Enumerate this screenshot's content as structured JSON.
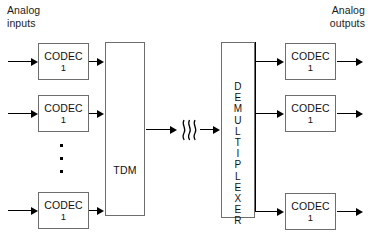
{
  "diagram": {
    "title_left": "Analog\ninputs",
    "title_right": "Analog\noutputs",
    "mux_label": "TDM",
    "demux_label": "DEMULTIPLEXER",
    "demux_letters": [
      "D",
      "E",
      "M",
      "U",
      "L",
      "T",
      "I",
      "P",
      "L",
      "E",
      "X",
      "E",
      "R"
    ],
    "codec_name": "CODEC",
    "codec_number": "1",
    "break_symbol": "transmission-link-break",
    "ellipsis": "vertical-ellipsis",
    "colors": {
      "stroke": "#000000",
      "box_border": "#6d6d6d",
      "text": "#111111",
      "background": "#ffffff"
    },
    "input_codecs": [
      {
        "name": "CODEC",
        "number": "1"
      },
      {
        "name": "CODEC",
        "number": "1"
      },
      {
        "name": "CODEC",
        "number": "1"
      }
    ],
    "output_codecs": [
      {
        "name": "CODEC",
        "number": "1"
      },
      {
        "name": "CODEC",
        "number": "1"
      },
      {
        "name": "CODEC",
        "number": "1"
      }
    ]
  }
}
